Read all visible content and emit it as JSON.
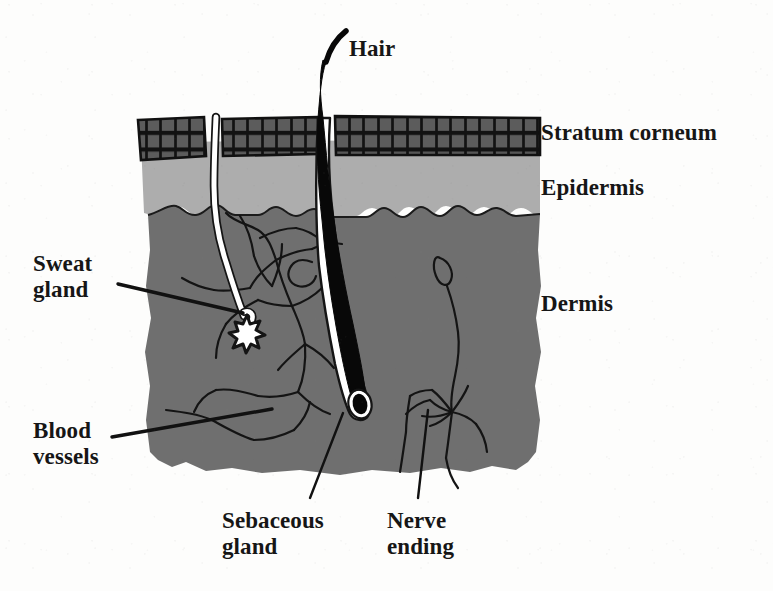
{
  "figure": {
    "background_color": "#fdfdfc"
  },
  "colors": {
    "stratum_corneum_cell": "#5c5c5c",
    "stratum_corneum_mortar": "#111111",
    "epidermis": "#adadad",
    "dermis": "#6f6f6f",
    "hair": "#000000",
    "follicle_sheath": "#ffffff",
    "sweat_duct": "#ffffff",
    "vessel_line": "#111111",
    "nerve_line": "#111111",
    "label_text": "#161616"
  },
  "labels": {
    "hair": {
      "text": "Hair",
      "x": 349,
      "y": 36
    },
    "stratum_corneum": {
      "text": "Stratum corneum",
      "x": 541,
      "y": 120
    },
    "epidermis": {
      "text": "Epidermis",
      "x": 541,
      "y": 175
    },
    "dermis": {
      "text": "Dermis",
      "x": 541,
      "y": 291
    },
    "sweat_gland": {
      "text": "Sweat\ngland",
      "x": 33,
      "y": 251
    },
    "blood_vessels": {
      "text": "Blood\nvessels",
      "x": 33,
      "y": 418
    },
    "sebaceous_gland": {
      "text": "Sebaceous\ngland",
      "x": 222,
      "y": 508
    },
    "nerve_ending": {
      "text": "Nerve\nending",
      "x": 387,
      "y": 508
    }
  },
  "structures": [
    {
      "name": "stratum-corneum",
      "description": "Outermost brick-patterned keratin layer"
    },
    {
      "name": "epidermis",
      "description": "Light gray layer beneath stratum corneum"
    },
    {
      "name": "dermis",
      "description": "Thick mid-gray layer with wavy upper boundary"
    },
    {
      "name": "hair-shaft",
      "description": "Black hair emerging above the skin surface"
    },
    {
      "name": "hair-follicle",
      "description": "White sheath surrounding hair down to bulb in dermis"
    },
    {
      "name": "sweat-duct",
      "description": "White duct from surface to coiled gland"
    },
    {
      "name": "sweat-gland",
      "description": "White star-shaped coiled gland in dermis"
    },
    {
      "name": "sebaceous-gland",
      "description": "Gland attached beside the hair follicle"
    },
    {
      "name": "blood-vessels",
      "description": "Branching black vessel network in dermis"
    },
    {
      "name": "nerve-ending",
      "description": "Branching nerve with corpuscle in dermis"
    }
  ],
  "leader_lines": [
    {
      "name": "sweat-gland-leader",
      "from": [
        118,
        284
      ],
      "to": [
        243,
        313
      ]
    },
    {
      "name": "blood-vessels-leader",
      "from": [
        112,
        437
      ],
      "to": [
        272,
        409
      ]
    },
    {
      "name": "sebaceous-leader",
      "from": [
        310,
        498
      ],
      "to": [
        343,
        413
      ]
    },
    {
      "name": "nerve-leader",
      "from": [
        418,
        498
      ],
      "to": [
        428,
        410
      ]
    }
  ]
}
